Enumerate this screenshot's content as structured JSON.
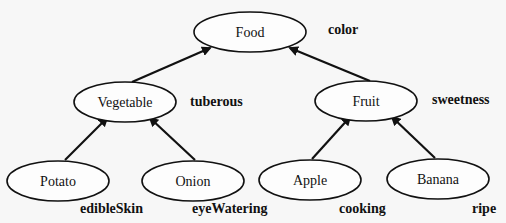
{
  "nodes": [
    {
      "id": "food",
      "label": "Food",
      "cx": 250,
      "cy": 32,
      "rx": 56,
      "ry": 20,
      "attr": "color",
      "ax": 328,
      "ay": 34
    },
    {
      "id": "vegetable",
      "label": "Vegetable",
      "cx": 125,
      "cy": 102,
      "rx": 51,
      "ry": 20,
      "attr": "tuberous",
      "ax": 190,
      "ay": 106
    },
    {
      "id": "fruit",
      "label": "Fruit",
      "cx": 366,
      "cy": 101,
      "rx": 51,
      "ry": 20,
      "attr": "sweetness",
      "ax": 432,
      "ay": 104
    },
    {
      "id": "potato",
      "label": "Potato",
      "cx": 58,
      "cy": 181,
      "rx": 51,
      "ry": 20,
      "attr": "edibleSkin",
      "ax": 80,
      "ay": 213
    },
    {
      "id": "onion",
      "label": "Onion",
      "cx": 193,
      "cy": 181,
      "rx": 51,
      "ry": 20,
      "attr": "eyeWatering",
      "ax": 192,
      "ay": 213
    },
    {
      "id": "apple",
      "label": "Apple",
      "cx": 310,
      "cy": 180,
      "rx": 51,
      "ry": 20,
      "attr": "cooking",
      "ax": 339,
      "ay": 213
    },
    {
      "id": "banana",
      "label": "Banana",
      "cx": 438,
      "cy": 179,
      "rx": 51,
      "ry": 20,
      "attr": "ripe",
      "ax": 472,
      "ay": 213
    }
  ],
  "edges": [
    {
      "from": "vegetable",
      "to": "food",
      "x1": 132,
      "y1": 82,
      "x2": 210,
      "y2": 48
    },
    {
      "from": "fruit",
      "to": "food",
      "x1": 370,
      "y1": 81,
      "x2": 290,
      "y2": 48
    },
    {
      "from": "potato",
      "to": "vegetable",
      "x1": 65,
      "y1": 160,
      "x2": 107,
      "y2": 118
    },
    {
      "from": "onion",
      "to": "vegetable",
      "x1": 195,
      "y1": 160,
      "x2": 150,
      "y2": 118
    },
    {
      "from": "apple",
      "to": "fruit",
      "x1": 312,
      "y1": 159,
      "x2": 350,
      "y2": 117
    },
    {
      "from": "banana",
      "to": "fruit",
      "x1": 435,
      "y1": 158,
      "x2": 392,
      "y2": 117
    }
  ]
}
